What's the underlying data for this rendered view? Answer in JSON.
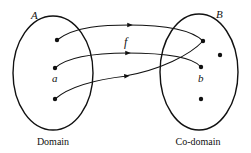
{
  "diagram": {
    "type": "function-mapping",
    "set_a": {
      "name": "A",
      "caption": "Domain",
      "element_label": "a"
    },
    "set_b": {
      "name": "B",
      "caption": "Co-domain",
      "element_label": "b"
    },
    "function_label": "f",
    "domain_points": 3,
    "codomain_points": 4,
    "mappings": [
      {
        "from": "A1",
        "to": "B1"
      },
      {
        "from": "A2 (a)",
        "to": "B3 (b)"
      },
      {
        "from": "A3",
        "to": "B1"
      }
    ],
    "colors": {
      "stroke": "#111111",
      "background": "#ffffff"
    }
  }
}
